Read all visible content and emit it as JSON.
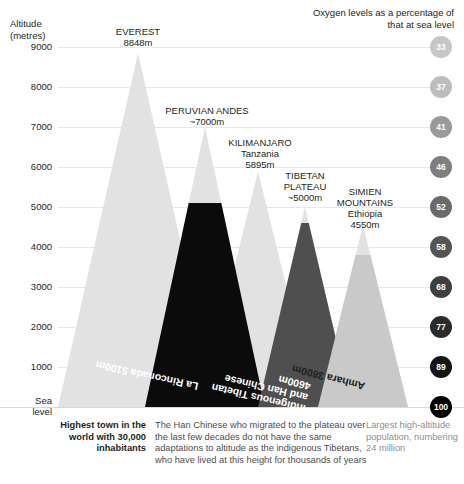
{
  "axis": {
    "title": "Altitude\n(metres)",
    "ticks": [
      "9000",
      "8000",
      "7000",
      "6000",
      "5000",
      "4000",
      "3000",
      "2000",
      "1000",
      "Sea\nlevel"
    ],
    "tick_values": [
      9000,
      8000,
      7000,
      6000,
      5000,
      4000,
      3000,
      2000,
      1000,
      0
    ]
  },
  "legend": {
    "title": "Oxygen levels as a percentage\nof that at sea level",
    "circles": [
      {
        "value": "33",
        "altitude": 9000,
        "color": "#c6c6c6"
      },
      {
        "value": "37",
        "altitude": 8000,
        "color": "#bdbdbd"
      },
      {
        "value": "41",
        "altitude": 7000,
        "color": "#9a9a9a"
      },
      {
        "value": "46",
        "altitude": 6000,
        "color": "#7e7e7e"
      },
      {
        "value": "52",
        "altitude": 5000,
        "color": "#6a6a6a"
      },
      {
        "value": "58",
        "altitude": 4000,
        "color": "#555555"
      },
      {
        "value": "68",
        "altitude": 3000,
        "color": "#3f3f3f"
      },
      {
        "value": "77",
        "altitude": 2000,
        "color": "#2b2b2b"
      },
      {
        "value": "89",
        "altitude": 1000,
        "color": "#151515"
      },
      {
        "value": "100",
        "altitude": 0,
        "color": "#000000"
      }
    ]
  },
  "mountains": [
    {
      "key": "everest",
      "label": "EVEREST\n8848m",
      "peak_m": 8848,
      "apex_x": 138,
      "base_left": 58,
      "base_right": 218,
      "label_x": 138,
      "label_y": 26,
      "fill": "#e2e2e2"
    },
    {
      "key": "peruvian_andes",
      "label": "PERUVIAN ANDES\n~7000m",
      "peak_m": 7000,
      "apex_x": 205,
      "base_left": 145,
      "base_right": 265,
      "label_x": 207,
      "label_y": 105,
      "fill": "#e2e2e2"
    },
    {
      "key": "kilimanjaro",
      "label": "KILIMANJARO\nTanzania\n5895m",
      "peak_m": 5895,
      "apex_x": 258,
      "base_left": 200,
      "base_right": 316,
      "label_x": 260,
      "label_y": 137,
      "fill": "#e2e2e2"
    },
    {
      "key": "tibetan_plateau",
      "label": "TIBETAN\nPLATEAU\n~5000m",
      "peak_m": 5000,
      "apex_x": 305,
      "base_left": 258,
      "base_right": 352,
      "label_x": 305,
      "label_y": 170,
      "fill": "#e2e2e2"
    },
    {
      "key": "simien_mountains",
      "label": "SIMIEN\nMOUNTAINS\nEthiopia\n4550m",
      "peak_m": 4550,
      "apex_x": 363,
      "base_left": 318,
      "base_right": 408,
      "label_x": 365,
      "label_y": 186,
      "fill": "#e2e2e2"
    }
  ],
  "bands": [
    {
      "key": "la-rinconada",
      "label": "La Rinconada 5100m",
      "altitude_m": 5100,
      "mountain": "peruvian_andes",
      "fill": "#0b0b0b",
      "text_color": "#ffffff"
    },
    {
      "key": "tibetan-han",
      "label": "Indigenous Tibetan\nand Han Chinese\n4600m",
      "altitude_m": 4600,
      "mountain": "tibetan_plateau",
      "fill": "#4f4f4f",
      "text_color": "#ffffff"
    },
    {
      "key": "amhara",
      "label": "Amhara 3800m",
      "altitude_m": 3800,
      "mountain": "simien_mountains",
      "fill": "#c9c9c9",
      "text_color": "#231f20"
    }
  ],
  "captions": {
    "highest_town": "Highest town\nin the world\nwith 30,000\ninhabitants",
    "han_chinese": "The Han Chinese who migrated to the\nplateau over the last few decades do not\nhave the same adaptations to altitude as\nthe indigenous Tibetans, who have lived\nat this height for thousands of years",
    "largest_population": "Largest\nhigh-altitude\npopulation,\nnumbering\n24 million"
  }
}
